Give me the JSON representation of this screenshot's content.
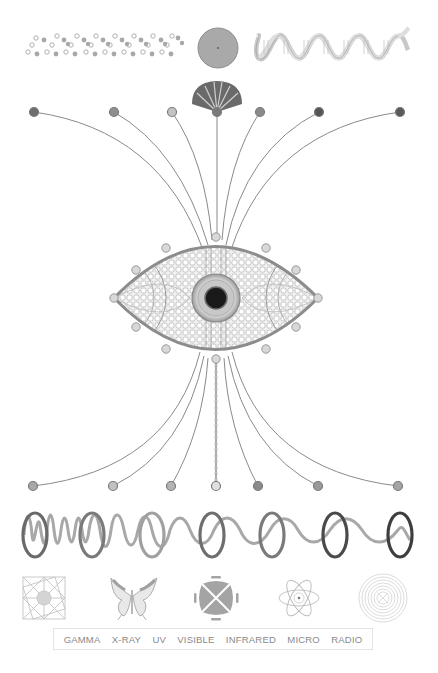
{
  "palette": {
    "background": "#ffffff",
    "line": "#8c8c8c",
    "dark": "#4a4a4a",
    "mid": "#9a9a9a",
    "light": "#d2d2d2"
  },
  "top_row": {
    "items": [
      {
        "icon": "molecule-chain-icon"
      },
      {
        "icon": "disc-icon"
      },
      {
        "icon": "dna-helix-icon"
      }
    ]
  },
  "fan_icon": "ginkgo-fan-icon",
  "top_nodes": [
    {
      "x": 34,
      "fill": "#6e6e6e"
    },
    {
      "x": 114,
      "fill": "#8f8f8f"
    },
    {
      "x": 172,
      "fill": "#c4c4c4"
    },
    {
      "x": 217,
      "fill": "#7a7a7a"
    },
    {
      "x": 260,
      "fill": "#8a8a8a"
    },
    {
      "x": 319,
      "fill": "#555555"
    },
    {
      "x": 400,
      "fill": "#5a5a5a"
    }
  ],
  "bottom_nodes": [
    {
      "x": 33,
      "fill": "#a8a8a8"
    },
    {
      "x": 113,
      "fill": "#c2c2c2"
    },
    {
      "x": 171,
      "fill": "#b4b4b4"
    },
    {
      "x": 216,
      "fill": "#e0e0e0"
    },
    {
      "x": 258,
      "fill": "#8a8a8a"
    },
    {
      "x": 318,
      "fill": "#9a9a9a"
    },
    {
      "x": 398,
      "fill": "#a4a4a4"
    }
  ],
  "eye": {
    "icon": "eye-mandala-icon",
    "pupil_color": "#1a1a1a"
  },
  "wave": {
    "icon": "wavelength-wave-icon"
  },
  "spectrum_icons": [
    {
      "name": "gamma",
      "icon": "sacred-geometry-icon"
    },
    {
      "name": "x-ray",
      "icon": "butterfly-icon"
    },
    {
      "name": "uv",
      "icon": "uv-pattern-icon"
    },
    {
      "name": "infrared",
      "icon": "atom-icon"
    },
    {
      "name": "radio",
      "icon": "concentric-rings-icon"
    }
  ],
  "labels": [
    "GAMMA",
    "X-RAY",
    "UV",
    "VISIBLE",
    "INFRARED",
    "MICRO",
    "RADIO"
  ]
}
